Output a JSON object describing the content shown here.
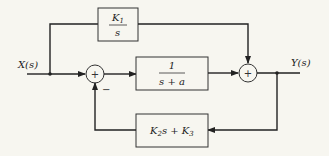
{
  "diagram": {
    "type": "block-diagram",
    "input": {
      "label": "X(s)"
    },
    "output": {
      "label": "Y(s)"
    },
    "blocks": [
      {
        "id": "feedforward",
        "numerator": "K",
        "numerator_sub": "1",
        "denominator": "s"
      },
      {
        "id": "plant",
        "numerator": "1",
        "denominator": "s + a"
      },
      {
        "id": "feedback",
        "text": "K",
        "sub1": "2",
        "mid": "s + K",
        "sub2": "3"
      }
    ],
    "summers": [
      {
        "id": "sum1",
        "symbol": "+",
        "feedback_sign": "−"
      },
      {
        "id": "sum2",
        "symbol": "+"
      }
    ]
  },
  "colors": {
    "background": "#f7f6f0",
    "line": "#222222"
  }
}
